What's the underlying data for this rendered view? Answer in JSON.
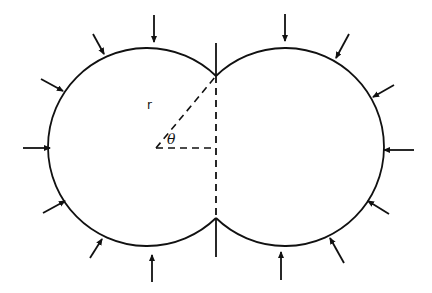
{
  "figure": {
    "labels": {
      "radius": "r",
      "angle": "θ"
    },
    "colors": {
      "stroke": "#111111",
      "background": "#ffffff"
    },
    "geometry": {
      "left_circle": {
        "cx": 156,
        "cy": 147,
        "r": 99
      },
      "right_circle": {
        "cx": 277,
        "cy": 147,
        "r": 99
      },
      "contact_line": {
        "x": 216,
        "y1": 43,
        "y2": 257
      },
      "intersection_top": {
        "x": 216,
        "y": 76
      },
      "intersection_bottom": {
        "x": 216,
        "y": 218
      }
    },
    "arrows": [
      {
        "id": "left-top",
        "x1": 154,
        "y1": 15,
        "x2": 154,
        "y2": 42
      },
      {
        "id": "left-upper-1",
        "x1": 93,
        "y1": 34,
        "x2": 104,
        "y2": 54
      },
      {
        "id": "left-upper-2",
        "x1": 41,
        "y1": 79,
        "x2": 63,
        "y2": 91
      },
      {
        "id": "left-middle",
        "x1": 23,
        "y1": 148,
        "x2": 50,
        "y2": 148
      },
      {
        "id": "left-lower-1",
        "x1": 43,
        "y1": 213,
        "x2": 65,
        "y2": 201
      },
      {
        "id": "left-lower-2",
        "x1": 90,
        "y1": 258,
        "x2": 102,
        "y2": 239
      },
      {
        "id": "left-bottom",
        "x1": 152,
        "y1": 282,
        "x2": 152,
        "y2": 255
      },
      {
        "id": "right-top",
        "x1": 285,
        "y1": 14,
        "x2": 285,
        "y2": 41
      },
      {
        "id": "right-upper-1",
        "x1": 349,
        "y1": 34,
        "x2": 336,
        "y2": 58
      },
      {
        "id": "right-upper-2",
        "x1": 394,
        "y1": 85,
        "x2": 373,
        "y2": 97
      },
      {
        "id": "right-middle",
        "x1": 414,
        "y1": 150,
        "x2": 384,
        "y2": 150
      },
      {
        "id": "right-lower-1",
        "x1": 389,
        "y1": 214,
        "x2": 368,
        "y2": 201
      },
      {
        "id": "right-lower-2",
        "x1": 344,
        "y1": 263,
        "x2": 330,
        "y2": 238
      },
      {
        "id": "right-bottom",
        "x1": 281,
        "y1": 280,
        "x2": 281,
        "y2": 252
      }
    ]
  }
}
